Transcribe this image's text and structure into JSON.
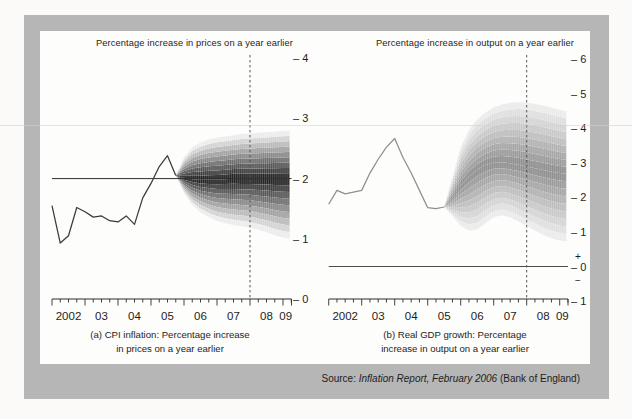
{
  "figure": {
    "source": {
      "prefix": "Source: ",
      "italic": "Inflation Report, February 2006",
      "suffix": " (Bank of England)"
    }
  },
  "colors": {
    "page_bg": "#fbfaf8",
    "frame_bg": "#b6b6b6",
    "panel_bg": "#fdfdfc",
    "text": "#1d1d1d",
    "axis": "#2e2e2e",
    "dashed_divider": "#555555",
    "scan_artifact_line": "rgba(208,208,208,0.55)"
  },
  "chart_data": [
    {
      "id": "cpi-inflation",
      "type": "line",
      "subtype": "fan-chart",
      "title": "Percentage increase in prices on a year earlier",
      "caption": [
        "(a) CPI inflation: Percentage increase",
        "in prices on a year earlier"
      ],
      "x_axis": {
        "start": 2002,
        "end": 2009.25,
        "year_labels": [
          "2002",
          "03",
          "04",
          "05",
          "06",
          "07",
          "08",
          "09"
        ],
        "quarter_ticks": true
      },
      "y_axis": {
        "min": 0,
        "max": 4,
        "ticks": [
          4,
          3,
          2,
          1,
          0
        ],
        "side": "right"
      },
      "reference_line": 2,
      "forecast_horizon": 2008,
      "history": {
        "start": 2002,
        "step": 0.25,
        "values": [
          1.55,
          0.93,
          1.05,
          1.52,
          1.45,
          1.36,
          1.38,
          1.3,
          1.28,
          1.38,
          1.24,
          1.68,
          1.92,
          2.2,
          2.38,
          2.05
        ]
      },
      "fan": {
        "x": [
          2005.75,
          2006,
          2006.25,
          2006.5,
          2006.75,
          2007,
          2007.25,
          2007.5,
          2007.75,
          2008,
          2008.25,
          2008.5,
          2008.75,
          2009,
          2009.2
        ],
        "top": [
          2.05,
          2.35,
          2.52,
          2.6,
          2.65,
          2.68,
          2.7,
          2.72,
          2.74,
          2.75,
          2.76,
          2.77,
          2.78,
          2.79,
          2.8
        ],
        "center": [
          2.05,
          2.01,
          1.99,
          1.98,
          1.98,
          1.98,
          1.99,
          2.0,
          2.0,
          2.0,
          2.0,
          2.0,
          2.0,
          2.0,
          2.0
        ],
        "bottom": [
          2.05,
          1.76,
          1.56,
          1.44,
          1.36,
          1.3,
          1.26,
          1.23,
          1.21,
          1.19,
          1.15,
          1.11,
          1.06,
          1.02,
          1.0
        ]
      },
      "line_color": "#3a3a3a",
      "reference_color": "#2e2e2e",
      "fan_dark": "#242424",
      "fan_light": "#ececec"
    },
    {
      "id": "real-gdp-growth",
      "type": "line",
      "subtype": "fan-chart",
      "title": "Percentage increase in output on a year earlier",
      "caption": [
        "(b) Real GDP growth: Percentage",
        "increase in output on a year earlier"
      ],
      "x_axis": {
        "start": 2002,
        "end": 2009.25,
        "year_labels": [
          "2002",
          "03",
          "04",
          "05",
          "06",
          "07",
          "08",
          "09"
        ],
        "quarter_ticks": true
      },
      "y_axis": {
        "min": -1,
        "max": 6,
        "ticks": [
          6,
          5,
          4,
          3,
          2,
          1,
          0,
          -1
        ],
        "side": "right"
      },
      "zero_marks": {
        "plus": "+",
        "minus": "−"
      },
      "reference_line": 0,
      "forecast_horizon": 2008,
      "history": {
        "start": 2002,
        "step": 0.25,
        "values": [
          1.8,
          2.2,
          2.1,
          2.15,
          2.2,
          2.7,
          3.1,
          3.45,
          3.7,
          3.15,
          2.7,
          2.2,
          1.7,
          1.67,
          1.72
        ]
      },
      "fan": {
        "x": [
          2005.5,
          2005.75,
          2006,
          2006.25,
          2006.5,
          2006.75,
          2007,
          2007.25,
          2007.5,
          2007.75,
          2008,
          2008.25,
          2008.5,
          2008.75,
          2009,
          2009.2
        ],
        "top": [
          1.72,
          2.6,
          3.45,
          3.95,
          4.25,
          4.45,
          4.6,
          4.68,
          4.73,
          4.75,
          4.74,
          4.7,
          4.65,
          4.59,
          4.53,
          4.48
        ],
        "center": [
          1.72,
          2.0,
          2.35,
          2.6,
          2.8,
          2.93,
          3.0,
          3.01,
          2.98,
          2.94,
          2.89,
          2.84,
          2.79,
          2.74,
          2.7,
          2.68
        ],
        "bottom": [
          1.72,
          1.45,
          1.18,
          1.04,
          1.07,
          1.25,
          1.42,
          1.48,
          1.42,
          1.3,
          1.17,
          1.04,
          0.92,
          0.82,
          0.75,
          0.72
        ]
      },
      "line_color": "#8f8f8f",
      "reference_color": "#4a4a4a",
      "fan_dark": "#8e8e8e",
      "fan_light": "#ebebeb"
    }
  ]
}
